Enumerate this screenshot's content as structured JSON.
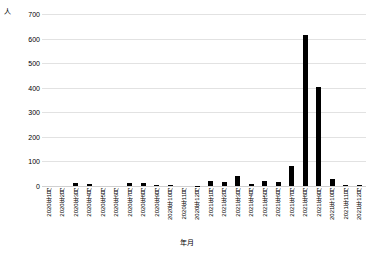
{
  "chart_data": {
    "type": "bar",
    "title": "",
    "xlabel": "年月",
    "ylabel": "人",
    "ylim": [
      0,
      700
    ],
    "yticks": [
      0,
      100,
      200,
      300,
      400,
      500,
      600,
      700
    ],
    "grid": true,
    "legend": "none",
    "bar_color": "#000000",
    "categories": [
      "2020年1月",
      "2020年2月",
      "2020年3月",
      "2020年4月",
      "2020年5月",
      "2020年6月",
      "2020年7月",
      "2020年8月",
      "2020年9月",
      "2020年10月",
      "2020年11月",
      "2020年12月",
      "2021年1月",
      "2021年2月",
      "2021年3月",
      "2021年4月",
      "2021年5月",
      "2021年6月",
      "2021年7月",
      "2021年8月",
      "2021年9月",
      "2021年10月",
      "2021年11月",
      "2021年12月"
    ],
    "values": [
      0,
      0,
      13,
      8,
      0,
      0,
      12,
      12,
      5,
      3,
      0,
      2,
      20,
      18,
      40,
      8,
      22,
      15,
      80,
      615,
      405,
      30,
      5,
      5
    ]
  }
}
